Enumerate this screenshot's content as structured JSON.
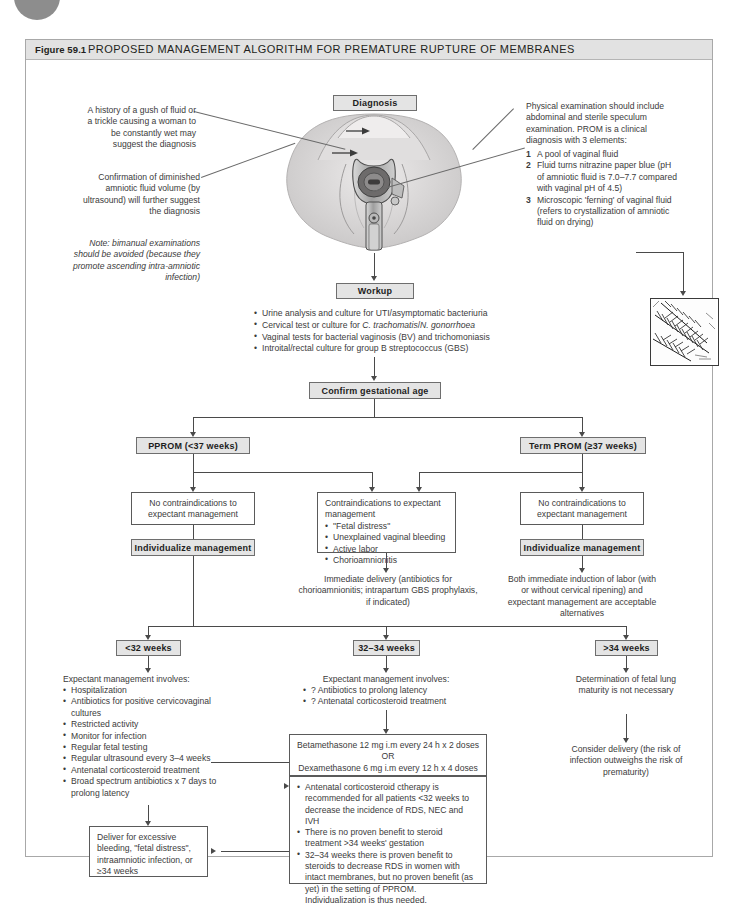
{
  "figure": {
    "number": "Figure 59.1",
    "title": "PROPOSED MANAGEMENT ALGORITHM FOR PREMATURE RUPTURE OF MEMBRANES"
  },
  "nodes": {
    "diagnosis": "Diagnosis",
    "workup": "Workup",
    "confirm_ga": "Confirm gestational age",
    "pprom": "PPROM (<37 weeks)",
    "term_prom": "Term PROM (≥37 weeks)",
    "individualize_left": "Individualize management",
    "individualize_right": "Individualize management",
    "lt32": "<32 weeks",
    "w32_34": "32–34 weeks",
    "gt34": ">34 weeks"
  },
  "left_annotations": {
    "history": "A history of a gush of fluid or a trickle causing a woman to be constantly wet may suggest the diagnosis",
    "confirmation": "Confirmation of diminished amniotic fluid volume (by ultrasound) will further suggest the diagnosis",
    "note": "Note: bimanual examinations should be avoided (because they promote ascending intra-amniotic infection)"
  },
  "right_annotations": {
    "intro": "Physical examination should include abdominal and sterile speculum examination. PROM is a clinical diagnosis with 3 elements:",
    "items": [
      "A pool of vaginal fluid",
      "Fluid turns nitrazine paper blue (pH of amniotic fluid is 7.0–7.7 compared with vaginal pH of 4.5)",
      "Microscopic 'ferning' of vaginal fluid (refers to crystallization of amniotic fluid on drying)"
    ]
  },
  "workup_items": [
    "Urine analysis and culture for UTI/asymptomatic bacteriuria",
    "Cervical test or culture for C. trachomatis/N. gonorrhoea",
    "Vaginal tests for bacterial vaginosis (BV) and trichomoniasis",
    "Introital/rectal culture for group B streptococcus (GBS)"
  ],
  "boxes": {
    "no_contra_left": "No contraindications to expectant management",
    "no_contra_right": "No contraindications to expectant management",
    "contra_title": "Contraindications to expectant management",
    "contra_items": [
      "\"Fetal distress\"",
      "Unexplained vaginal bleeding",
      "Active labor",
      "Chorioamnionitis"
    ],
    "immediate_delivery": "Immediate delivery (antibiotics for chorioamnionitis; intrapartum GBS prophylaxis, if indicated)",
    "both_immediate": "Both immediate induction of labor (with or without cervical ripening) and expectant management are acceptable alternatives"
  },
  "columns": {
    "left": {
      "heading": "Expectant management involves:",
      "items": [
        "Hospitalization",
        "Antibiotics for positive cervicovaginal cultures",
        "Restricted activity",
        "Monitor for infection",
        "Regular fetal testing",
        "Regular ultrasound every 3–4 weeks",
        "Antenatal corticosteroid treatment",
        "Broad spectrum antibiotics x 7 days to prolong latency"
      ],
      "deliver_box": "Deliver for excessive bleeding, \"fetal distress\", intraamniotic infection, or ≥34 weeks"
    },
    "middle": {
      "heading": "Expectant management involves:",
      "items": [
        "? Antibiotics to prolong latency",
        "? Antenatal corticosteroid treatment"
      ],
      "steroid_dosing": [
        "Betamethasone 12 mg i.m every 24 h x 2 doses",
        "OR",
        "Dexamethasone 6 mg i.m every 12 h x 4 doses"
      ],
      "steroid_notes": [
        "Antenatal corticosteroid ctherapy is recommended for all patients <32 weeks to decrease the incidence of RDS, NEC and IVH",
        "There is no proven benefit to steroid treatment >34 weeks' gestation",
        "32–34 weeks there is proven benefit to steroids to decrease RDS in women with intact membranes, but no proven benefit (as yet) in the setting of PPROM. Individualization is thus needed."
      ]
    },
    "right": {
      "determination": "Determination of fetal lung maturity is not necessary",
      "consider_delivery": "Consider delivery (the risk of infection outweighs the risk of prematurity)"
    }
  },
  "colors": {
    "box_fill": "#e4e4e4",
    "frame": "#a8a8a8",
    "line": "#4a4a4a",
    "text": "#3b3b3b"
  }
}
